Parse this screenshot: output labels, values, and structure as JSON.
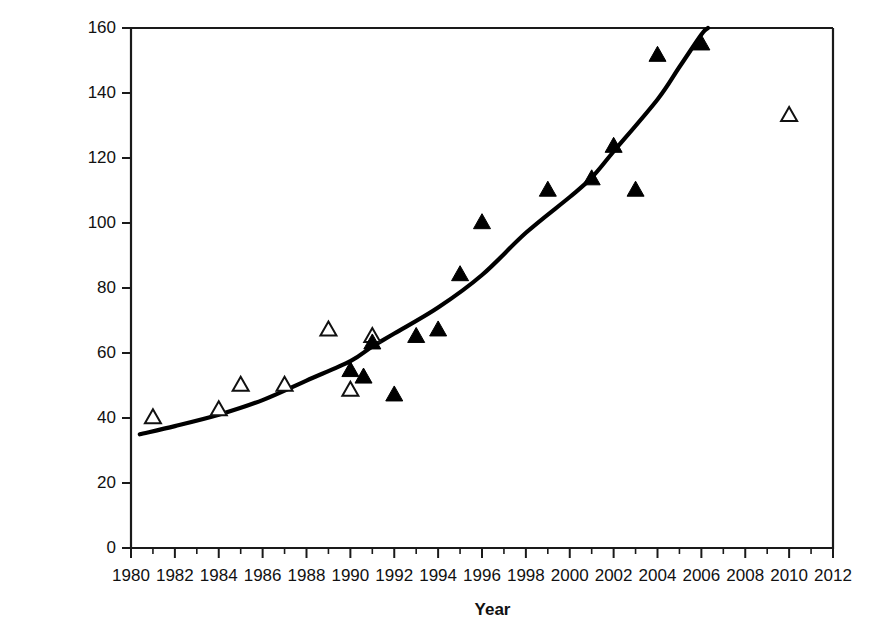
{
  "chart_data": {
    "type": "scatter",
    "title": "",
    "xlabel": "Year",
    "ylabel": "Population size (thousands)",
    "xlim": [
      1980,
      2012
    ],
    "ylim": [
      0,
      160
    ],
    "x_major_step": 2,
    "x_minor_step": 1,
    "y_major_step": 20,
    "grid": false,
    "legend": "none",
    "x_tick_labels": [
      "1980",
      "1982",
      "1984",
      "1986",
      "1988",
      "1990",
      "1992",
      "1994",
      "1996",
      "1998",
      "2000",
      "2002",
      "2004",
      "2006",
      "2008",
      "2010",
      "2012"
    ],
    "y_tick_labels": [
      "0",
      "20",
      "40",
      "60",
      "80",
      "100",
      "120",
      "140",
      "160"
    ],
    "series": [
      {
        "name": "open-triangle-estimates",
        "marker": "open-triangle",
        "points": [
          {
            "x": 1981,
            "y": 40
          },
          {
            "x": 1984,
            "y": 42.5
          },
          {
            "x": 1985,
            "y": 50
          },
          {
            "x": 1987,
            "y": 50
          },
          {
            "x": 1989,
            "y": 67
          },
          {
            "x": 1990,
            "y": 48.5
          },
          {
            "x": 1991,
            "y": 65
          },
          {
            "x": 2010,
            "y": 133
          }
        ]
      },
      {
        "name": "filled-triangle-counts",
        "marker": "filled-triangle",
        "points": [
          {
            "x": 1990,
            "y": 54.5
          },
          {
            "x": 1990.6,
            "y": 52.5
          },
          {
            "x": 1991,
            "y": 63
          },
          {
            "x": 1992,
            "y": 47
          },
          {
            "x": 1993,
            "y": 65
          },
          {
            "x": 1994,
            "y": 67
          },
          {
            "x": 1995,
            "y": 84
          },
          {
            "x": 1996,
            "y": 100
          },
          {
            "x": 1999,
            "y": 110
          },
          {
            "x": 2001,
            "y": 113.5
          },
          {
            "x": 2002,
            "y": 123.5
          },
          {
            "x": 2003,
            "y": 110
          },
          {
            "x": 2004,
            "y": 151.5
          },
          {
            "x": 2006,
            "y": 155
          }
        ]
      }
    ],
    "fitted_curve": {
      "name": "exponential-trend-line",
      "points": [
        {
          "x": 1980.4,
          "y": 35
        },
        {
          "x": 1982,
          "y": 37.5
        },
        {
          "x": 1984,
          "y": 41
        },
        {
          "x": 1986,
          "y": 45.5
        },
        {
          "x": 1988,
          "y": 51.5
        },
        {
          "x": 1990,
          "y": 57.5
        },
        {
          "x": 1991,
          "y": 62
        },
        {
          "x": 1992,
          "y": 66
        },
        {
          "x": 1994,
          "y": 74
        },
        {
          "x": 1996,
          "y": 84
        },
        {
          "x": 1998,
          "y": 97
        },
        {
          "x": 2000,
          "y": 108
        },
        {
          "x": 2001,
          "y": 114
        },
        {
          "x": 2002,
          "y": 122
        },
        {
          "x": 2004,
          "y": 138
        },
        {
          "x": 2005,
          "y": 148
        },
        {
          "x": 2006,
          "y": 158
        },
        {
          "x": 2006.3,
          "y": 160
        }
      ]
    },
    "colors": {
      "axis": "#1a1a1a",
      "curve": "#000000",
      "marker_filled": "#000000",
      "marker_open_fill": "#ffffff",
      "marker_open_stroke": "#111111",
      "background": "#ffffff"
    }
  }
}
